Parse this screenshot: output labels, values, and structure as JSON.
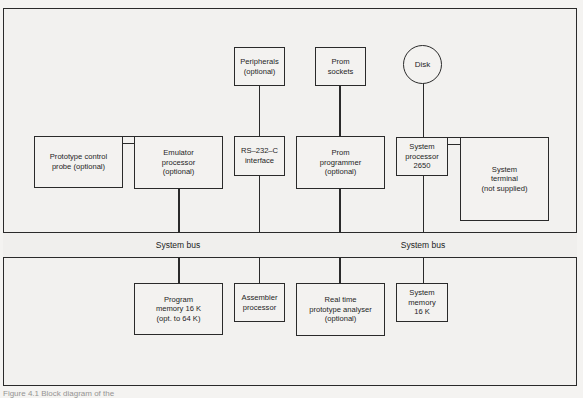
{
  "diagram": {
    "bus": {
      "label_left": "System bus",
      "label_right": "System bus"
    },
    "top_row": {
      "peripherals": "Peripherals\n(optional)",
      "prom_sockets": "Prom\nsockets",
      "disk": "Disk"
    },
    "middle_row": {
      "prototype_probe": "Prototype control\nprobe (optional)",
      "emulator_processor": "Emulator\nprocessor\n(optional)",
      "rs232_interface": "RS–232–C\ninterface",
      "prom_programmer": "Prom\nprogrammer\n(optional)",
      "system_processor": "System\nprocessor\n2650",
      "system_terminal": "System\nterminal\n(not supplied)"
    },
    "bottom_row": {
      "program_memory": "Program\nmemory 16 K\n(opt. to 64 K)",
      "assembler_processor": "Assembler\nprocessor",
      "real_time_analyser": "Real time\nprototype analyser\n(optional)",
      "system_memory": "System\nmemory\n16 K"
    },
    "caption": "Figure 4.1  Block diagram of the"
  }
}
